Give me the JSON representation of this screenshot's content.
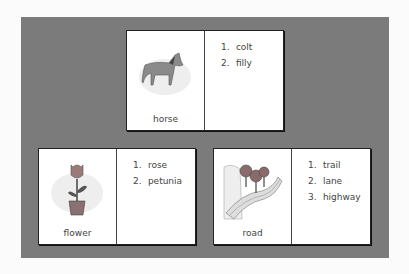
{
  "cards": [
    {
      "word": "horse",
      "image": "horse-illustration",
      "items": [
        "1.",
        "colt",
        "2.",
        "filly"
      ],
      "list": [
        {
          "n": "1.",
          "t": "colt"
        },
        {
          "n": "2.",
          "t": "filly"
        }
      ]
    },
    {
      "word": "flower",
      "image": "flower-pot-illustration",
      "list": [
        {
          "n": "1.",
          "t": "rose"
        },
        {
          "n": "2.",
          "t": "petunia"
        }
      ]
    },
    {
      "word": "road",
      "image": "road-with-trees-illustration",
      "list": [
        {
          "n": "1.",
          "t": "trail"
        },
        {
          "n": "2.",
          "t": "lane"
        },
        {
          "n": "3.",
          "t": "highway"
        }
      ]
    }
  ],
  "colors": {
    "panel": "#7b7b7b",
    "card": "#ffffff",
    "border": "#222222"
  }
}
